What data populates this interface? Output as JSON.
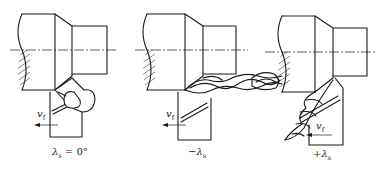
{
  "figure": {
    "panels": [
      {
        "id": "zero",
        "caption_symbol": "λ",
        "caption_sub": "s",
        "caption_rest": " = 0°",
        "feed_symbol": "v",
        "feed_sub": "f"
      },
      {
        "id": "negative",
        "caption_prefix": "−",
        "caption_symbol": "λ",
        "caption_sub": "s",
        "feed_symbol": "v",
        "feed_sub": "f"
      },
      {
        "id": "positive",
        "caption_prefix": "+",
        "caption_symbol": "λ",
        "caption_sub": "s",
        "feed_symbol": "v",
        "feed_sub": "f"
      }
    ],
    "colors": {
      "line": "#1a1a1a",
      "background": "#ffffff"
    }
  }
}
